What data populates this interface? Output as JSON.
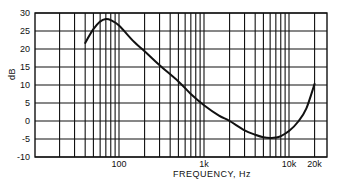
{
  "chart_data": {
    "type": "line",
    "title": "",
    "xlabel": "FREQUENCY, Hz",
    "ylabel": "dB",
    "xscale": "log",
    "xlim": [
      10,
      30000
    ],
    "ylim": [
      -10,
      30
    ],
    "grid": true,
    "legend": null,
    "x_tick_labels": [
      {
        "value": 100,
        "label": "100"
      },
      {
        "value": 1000,
        "label": "1k"
      },
      {
        "value": 10000,
        "label": "10k"
      },
      {
        "value": 20000,
        "label": "20k"
      }
    ],
    "y_ticks": [
      30,
      25,
      20,
      15,
      10,
      5,
      0,
      -5,
      -10
    ],
    "x_gridlines": [
      20,
      30,
      40,
      50,
      60,
      70,
      80,
      90,
      100,
      200,
      300,
      400,
      500,
      600,
      700,
      800,
      900,
      1000,
      2000,
      3000,
      4000,
      5000,
      6000,
      7000,
      8000,
      9000,
      10000,
      20000
    ],
    "series": [
      {
        "name": "response",
        "x": [
          40,
          50,
          60,
          70,
          80,
          100,
          150,
          200,
          300,
          500,
          700,
          1000,
          1500,
          2000,
          3000,
          4000,
          5000,
          6000,
          7000,
          8000,
          10000,
          13000,
          16000,
          20000
        ],
        "y": [
          21.7,
          25.5,
          27.6,
          28.3,
          28.0,
          26.5,
          22.0,
          19.4,
          15.5,
          11.0,
          7.5,
          4.4,
          1.5,
          0.0,
          -2.6,
          -3.8,
          -4.5,
          -4.7,
          -4.6,
          -4.2,
          -2.8,
          0.0,
          3.5,
          10.3
        ]
      }
    ]
  }
}
